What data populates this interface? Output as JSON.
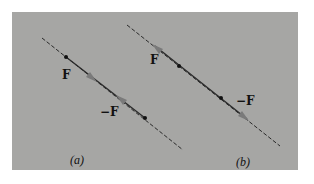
{
  "figure": {
    "colors": {
      "background": "#a6a6a4",
      "line": "#2a2a2a",
      "arrow": "#777777",
      "point": "#111111"
    },
    "panels": [
      {
        "caption": "(a)",
        "line": {
          "x1": 42,
          "y1": 38,
          "x2": 183,
          "y2": 150
        },
        "points": [
          {
            "x": 66,
            "y": 57
          },
          {
            "x": 145,
            "y": 118
          }
        ],
        "arrows": [
          {
            "x": 92,
            "y": 78,
            "direction": "down-right"
          },
          {
            "x": 121,
            "y": 99,
            "direction": "up-left"
          }
        ],
        "labels": [
          {
            "text": "F",
            "x": 61,
            "y": 69
          },
          {
            "text": "−F",
            "x": 99,
            "y": 106
          }
        ]
      },
      {
        "caption": "(b)",
        "line": {
          "x1": 127,
          "y1": 25,
          "x2": 280,
          "y2": 146
        },
        "points": [
          {
            "x": 179,
            "y": 66
          },
          {
            "x": 221,
            "y": 98
          }
        ],
        "arrows": [
          {
            "x": 157,
            "y": 48,
            "direction": "up-left"
          },
          {
            "x": 244,
            "y": 117,
            "direction": "down-right"
          }
        ],
        "labels": [
          {
            "text": "F",
            "x": 150,
            "y": 54
          },
          {
            "text": "−F",
            "x": 236,
            "y": 95
          }
        ]
      }
    ]
  }
}
